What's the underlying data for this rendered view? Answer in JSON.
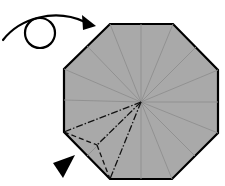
{
  "diagram": {
    "type": "origami-fold-step",
    "colors": {
      "paper": "#a9a9a9",
      "outline": "#000000",
      "crease": "#8f8f8f",
      "fold_line": "#111111",
      "background": "#ffffff"
    },
    "octagon": {
      "vertices": [
        [
          110,
          24
        ],
        [
          173,
          24
        ],
        [
          218,
          70
        ],
        [
          218,
          133
        ],
        [
          172,
          179
        ],
        [
          110,
          179
        ],
        [
          64,
          132
        ],
        [
          64,
          69
        ]
      ],
      "center": [
        141,
        102
      ]
    },
    "symbols": {
      "turn_over_arrow": "turn-over-icon",
      "push_arrow": "push-in-arrow-icon"
    }
  }
}
